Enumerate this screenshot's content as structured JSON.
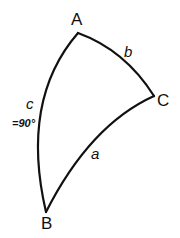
{
  "diagram": {
    "type": "spherical-triangle",
    "stroke_color": "#111111",
    "background": "#ffffff",
    "vertices": {
      "A": {
        "label": "A",
        "x": 78,
        "y": 33
      },
      "B": {
        "label": "B",
        "x": 46,
        "y": 212
      },
      "C": {
        "label": "C",
        "x": 154,
        "y": 96
      }
    },
    "sides": {
      "a": {
        "label": "a",
        "from": "B",
        "to": "C"
      },
      "b": {
        "label": "b",
        "from": "A",
        "to": "C"
      },
      "c": {
        "label": "c",
        "from": "A",
        "to": "B",
        "note": "=90°"
      }
    }
  }
}
